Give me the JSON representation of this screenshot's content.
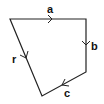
{
  "diagram": {
    "type": "vector-polygon",
    "stroke_color": "#222222",
    "background": "#ffffff",
    "vertices": [
      [
        10,
        19
      ],
      [
        86,
        19
      ],
      [
        86,
        72
      ],
      [
        42,
        96
      ]
    ],
    "edges": [
      {
        "label": "a",
        "from": [
          10,
          19
        ],
        "to": [
          86,
          19
        ],
        "arrow_at": [
          52,
          19
        ],
        "direction": "right"
      },
      {
        "label": "b",
        "from": [
          86,
          19
        ],
        "to": [
          86,
          72
        ],
        "arrow_at": [
          86,
          45
        ],
        "direction": "down"
      },
      {
        "label": "c",
        "from": [
          86,
          72
        ],
        "to": [
          42,
          96
        ],
        "arrow_at": [
          64,
          84
        ],
        "direction": "down-left"
      },
      {
        "label": "r",
        "from": [
          10,
          19
        ],
        "to": [
          42,
          96
        ],
        "arrow_at": [
          26,
          58
        ],
        "direction": "down-right"
      }
    ]
  }
}
